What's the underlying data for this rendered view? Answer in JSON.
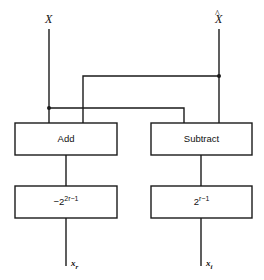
{
  "diagram": {
    "inputs": [
      {
        "label": "X",
        "hat": false
      },
      {
        "label": "X",
        "hat": true,
        "hat_glyph": "^"
      }
    ],
    "blocks": {
      "add": {
        "label": "Add"
      },
      "subtract": {
        "label": "Subtract"
      },
      "scale_real": {
        "sign": "−",
        "base": "2",
        "exponent": "2r−1"
      },
      "scale_imag": {
        "base": "2",
        "exponent": "r−1"
      }
    },
    "outputs": [
      {
        "base": "x",
        "subscript": "r"
      },
      {
        "base": "x",
        "subscript": "i"
      }
    ],
    "colors": {
      "line": "#1a1a1a",
      "background": "#ffffff"
    }
  }
}
